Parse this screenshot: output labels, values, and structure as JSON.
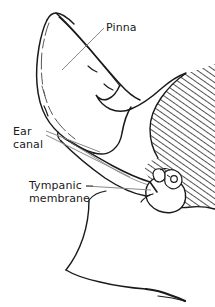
{
  "figure": {
    "type": "line-drawing-anatomical-diagram",
    "width": 215,
    "height": 307,
    "background_color": "#ffffff",
    "ink_color": "#1a1a1a",
    "leader_line_color": "#808080"
  },
  "labels": {
    "pinna": {
      "text": "Pinna",
      "lines": [
        "Pinna"
      ]
    },
    "ear_canal": {
      "text": "Ear canal",
      "lines": [
        "Ear",
        "canal"
      ],
      "line1": "Ear",
      "line2": "canal"
    },
    "tympanic_membrane": {
      "text": "Tympanic membrane",
      "lines": [
        "Tympanic",
        "membrane"
      ],
      "line1": "Tympanic",
      "line2": "membrane"
    }
  },
  "parts": {
    "pinna_outline": "pinna-outline",
    "ear_canal_passage": "ear-canal-passage",
    "tympanic_membrane_shape": "tympanic-membrane-shape",
    "temporal_bone_hatching": "temporal-bone-hatching",
    "jaw_neck_contour": "jaw-neck-contour",
    "ossicle_detail": "ossicle-detail"
  }
}
